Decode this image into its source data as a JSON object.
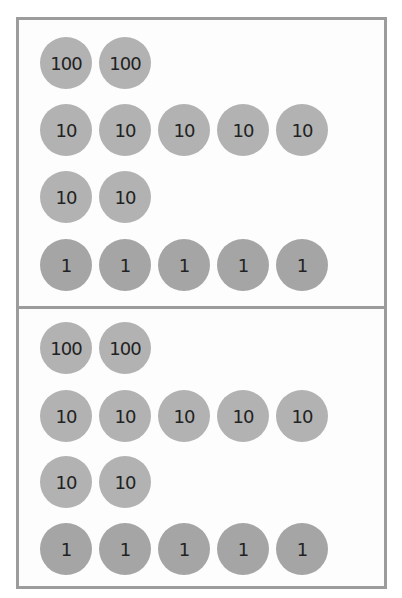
{
  "colors": {
    "border": "#9c9c9c",
    "disc_hundreds": "#b2b2b2",
    "disc_tens": "#b2b2b2",
    "disc_ones": "#a5a5a5",
    "text": "#222222"
  },
  "panels": [
    {
      "name": "top",
      "rows": [
        {
          "value": "100",
          "discs": [
            "100",
            "100"
          ]
        },
        {
          "value": "10",
          "discs": [
            "10",
            "10",
            "10",
            "10",
            "10"
          ]
        },
        {
          "value": "10",
          "discs": [
            "10",
            "10"
          ]
        },
        {
          "value": "1",
          "discs": [
            "1",
            "1",
            "1",
            "1",
            "1"
          ]
        }
      ]
    },
    {
      "name": "bottom",
      "rows": [
        {
          "value": "100",
          "discs": [
            "100",
            "100"
          ]
        },
        {
          "value": "10",
          "discs": [
            "10",
            "10",
            "10",
            "10",
            "10"
          ]
        },
        {
          "value": "10",
          "discs": [
            "10",
            "10"
          ]
        },
        {
          "value": "1",
          "discs": [
            "1",
            "1",
            "1",
            "1",
            "1"
          ]
        }
      ]
    }
  ]
}
